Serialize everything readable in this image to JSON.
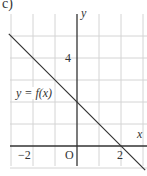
{
  "part_label": "c)",
  "chart_data": {
    "type": "line",
    "title": "",
    "xlabel": "x",
    "ylabel": "y",
    "function_label": "y = f(x)",
    "function": "f(x) = 2 - x",
    "series": [
      {
        "name": "y = f(x)",
        "x": [
          -3.1,
          3.1
        ],
        "y": [
          5.1,
          -1.1
        ]
      }
    ],
    "key_points": [
      {
        "x": 0,
        "y": 2,
        "note": "y-intercept"
      },
      {
        "x": 2,
        "y": 0,
        "note": "x-intercept"
      }
    ],
    "x_tick_labels": [
      "−2",
      "O",
      "2"
    ],
    "x_ticks": [
      -2,
      0,
      2
    ],
    "y_tick_labels": [
      "4"
    ],
    "y_ticks": [
      4
    ],
    "xlim": [
      -3.1,
      3.2
    ],
    "ylim": [
      -0.9,
      5.6
    ],
    "grid": true,
    "grid_step": 1,
    "legend": "none",
    "colors": {
      "line": "#333333",
      "axis": "#333333",
      "grid": "#d4d4d4"
    }
  },
  "labels": {
    "y_axis": "y",
    "x_axis": "x",
    "four": "4",
    "neg_two": "−2",
    "origin": "O",
    "two": "2",
    "function": "y = f(x)"
  }
}
